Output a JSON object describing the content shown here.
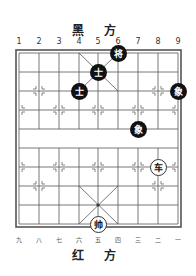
{
  "top_label": "黑 方",
  "bottom_label": "红 方",
  "file_numbers_top": [
    "1",
    "2",
    "3",
    "4",
    "5",
    "6",
    "7",
    "8",
    "9"
  ],
  "file_numbers_bottom": [
    "九",
    "八",
    "七",
    "六",
    "五",
    "四",
    "三",
    "二",
    "一"
  ],
  "pieces": [
    {
      "side": "black",
      "char": "将",
      "file": 6,
      "rank": 0
    },
    {
      "side": "black",
      "char": "士",
      "file": 5,
      "rank": 1
    },
    {
      "side": "black",
      "char": "士",
      "file": 4,
      "rank": 2
    },
    {
      "side": "black",
      "char": "象",
      "file": 9,
      "rank": 2
    },
    {
      "side": "black",
      "char": "象",
      "file": 7,
      "rank": 4
    },
    {
      "side": "red",
      "char": "车",
      "file": 8,
      "rank": 5
    },
    {
      "side": "red",
      "char": "帅",
      "file": 5,
      "rank": 9
    }
  ]
}
